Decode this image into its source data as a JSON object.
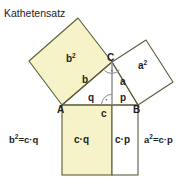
{
  "title": "Kathetensatz",
  "colors": {
    "background": "#ffffff",
    "fill_yellow": "#f7f3c8",
    "fill_white": "#ffffff",
    "stroke": "#5c5c3c",
    "altitude_line": "#8a8a8a",
    "text": "#1d1d1d"
  },
  "vertices": {
    "a": "A",
    "b": "B",
    "c": "C"
  },
  "sides": {
    "a": "a",
    "b": "b",
    "c": "c",
    "p": "p",
    "q": "q"
  },
  "squares": {
    "b_square": {
      "label": "b",
      "exponent": "2",
      "filled": "yellow"
    },
    "a_square": {
      "label": "a",
      "exponent": "2",
      "filled": "white"
    }
  },
  "rectangles": {
    "left": {
      "label": "c·q",
      "filled": "yellow"
    },
    "right": {
      "label": "c·p",
      "filled": "white"
    }
  },
  "formulas": {
    "left": {
      "base": "b",
      "exponent": "2",
      "rest": "=c·q",
      "full": "b²=c·q"
    },
    "right": {
      "base": "a",
      "exponent": "2",
      "rest": "=c·p",
      "full": "a²=c·p"
    }
  },
  "markers": {
    "right_angle_at_c": "right-angle-marker",
    "right_angle_at_foot": "right-angle-marker"
  }
}
